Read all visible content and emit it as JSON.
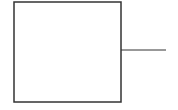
{
  "diagram": {
    "background": "#ffffff",
    "stroke_color": "#333333",
    "stroke_width": 1.5,
    "box": {
      "x": 14,
      "y": 2,
      "width": 107,
      "height": 100
    },
    "connector": {
      "x1": 121,
      "y1": 50,
      "x2": 166,
      "y2": 50
    }
  }
}
